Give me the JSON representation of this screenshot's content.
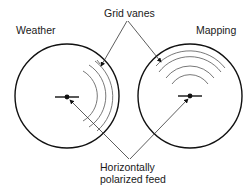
{
  "diagram": {
    "labels": {
      "grid_vanes": "Grid vanes",
      "weather": "Weather",
      "mapping": "Mapping",
      "feed_line1": "Horizontally",
      "feed_line2": "polarized feed"
    },
    "colors": {
      "stroke": "#111111",
      "thin_stroke": "#555555",
      "background": "#ffffff"
    },
    "antennas": [
      {
        "name": "Weather",
        "vane_orientation": "vertical arcs, right side"
      },
      {
        "name": "Mapping",
        "vane_orientation": "horizontal arcs, top side"
      }
    ]
  }
}
